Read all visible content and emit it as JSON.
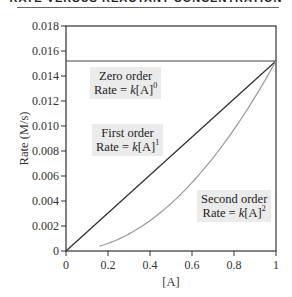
{
  "header": {
    "title": "RATE VERSUS REACTANT CONCENTRATION"
  },
  "annotations": [
    {
      "id": "zero",
      "line1": "Zero order",
      "prefix": "Rate = ",
      "k": "k",
      "bracket": "[A]",
      "exp": "0"
    },
    {
      "id": "first",
      "line1": "First order",
      "prefix": "Rate = ",
      "k": "k",
      "bracket": "[A]",
      "exp": "1"
    },
    {
      "id": "second",
      "line1": "Second order",
      "prefix": "Rate = ",
      "k": "k",
      "bracket": "[A]",
      "exp": "2"
    }
  ],
  "colors": {
    "axis": "#333333",
    "zero_order_line": "#444444",
    "first_order_line": "#333333",
    "second_order_curve": "#999999",
    "annotation_bg": "#ebebeb"
  },
  "chart_data": {
    "type": "line",
    "title": "Rate versus Reactant Concentration",
    "xlabel": "[A]",
    "ylabel": "Rate (M/s)",
    "xlim": [
      0,
      1
    ],
    "ylim": [
      0,
      0.018
    ],
    "x_ticks": [
      "0",
      "0.2",
      "0.4",
      "0.6",
      "0.8",
      "1"
    ],
    "y_ticks": [
      "0",
      "0.002",
      "0.004",
      "0.006",
      "0.008",
      "0.010",
      "0.012",
      "0.014",
      "0.016",
      "0.018"
    ],
    "grid": false,
    "legend": "inline annotations",
    "series": [
      {
        "name": "Zero order (Rate = k[A]^0)",
        "x": [
          0,
          1
        ],
        "y": [
          0.0152,
          0.0152
        ]
      },
      {
        "name": "First order (Rate = k[A]^1)",
        "x": [
          0,
          0.2,
          0.4,
          0.6,
          0.8,
          1
        ],
        "y": [
          0,
          0.00304,
          0.00608,
          0.00912,
          0.01216,
          0.0152
        ]
      },
      {
        "name": "Second order (Rate = k[A]^2)",
        "x": [
          0.16,
          0.2,
          0.4,
          0.6,
          0.8,
          1
        ],
        "y": [
          0.00039,
          0.00061,
          0.00243,
          0.00547,
          0.00973,
          0.0152
        ]
      }
    ]
  }
}
